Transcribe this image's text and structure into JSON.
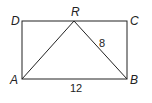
{
  "diagram": {
    "type": "geometry",
    "shape": "rectangle with inscribed triangle",
    "vertices": {
      "A": "A",
      "B": "B",
      "C": "C",
      "D": "D",
      "R": "R"
    },
    "measurements": {
      "RB": "8",
      "AB": "12"
    },
    "stroke_color": "#222222"
  }
}
